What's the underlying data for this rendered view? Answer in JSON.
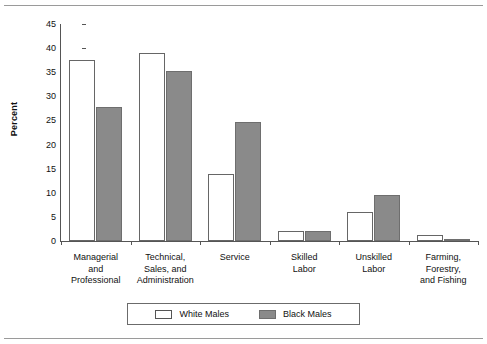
{
  "chart_data": {
    "type": "bar",
    "title": "",
    "subtitle": "",
    "xlabel": "",
    "ylabel": "Percent",
    "ylim": [
      0,
      45
    ],
    "ytick_step": 5,
    "yticks": [
      45,
      40,
      35,
      30,
      25,
      20,
      15,
      10,
      5,
      0
    ],
    "grid": false,
    "legend_position": "bottom-center",
    "categories": [
      "Managerial and Professional",
      "Technical, Sales, and Administration",
      "Service",
      "Skilled Labor",
      "Unskilled Labor",
      "Farming, Forestry, and Fishing"
    ],
    "category_lines": [
      [
        "Managerial",
        "and",
        "Professional"
      ],
      [
        "Technical,",
        "Sales, and",
        "Administration"
      ],
      [
        "Service"
      ],
      [
        "Skilled",
        "Labor"
      ],
      [
        "Unskilled",
        "Labor"
      ],
      [
        "Farming,",
        "Forestry,",
        "and Fishing"
      ]
    ],
    "series": [
      {
        "name": "White Males",
        "style": "white",
        "values": [
          37.6,
          38.9,
          13.9,
          2.1,
          6.1,
          1.2
        ]
      },
      {
        "name": "Black Males",
        "style": "gray",
        "values": [
          27.7,
          35.3,
          24.6,
          2.0,
          9.5,
          0.3
        ]
      }
    ]
  },
  "legend": {
    "entries": [
      {
        "label": "White Males",
        "swatch": "white-swatch-icon"
      },
      {
        "label": "Black Males",
        "swatch": "gray-swatch-icon"
      }
    ]
  },
  "colors": {
    "white_bar_fill": "#ffffff",
    "white_bar_border": "#666666",
    "gray_bar_fill": "#8a8a8a",
    "gray_bar_border": "#6e6e6e",
    "axis": "#555555",
    "text": "#111111",
    "frame_rule": "#9a9a9a",
    "background": "#ffffff"
  }
}
